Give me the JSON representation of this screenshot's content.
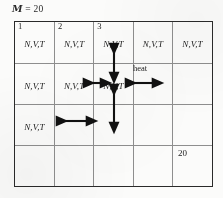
{
  "caption": {
    "symbol": "M",
    "equals": " = 20"
  },
  "colors": {
    "ink": "#1d1d1d",
    "outer_border": "#2a2a2a",
    "inner_border": "#8e8e8e",
    "page_background": "#fbfbfa"
  },
  "grid": {
    "columns": 5,
    "rows": 4,
    "rows_data": [
      {
        "cells": [
          {
            "corner": "1",
            "text": "N,V,T"
          },
          {
            "corner": "2",
            "text": "N,V,T"
          },
          {
            "corner": "3",
            "text": "N,V,T"
          },
          {
            "corner": "",
            "text": "N,V,T"
          },
          {
            "corner": "",
            "text": "N,V,T"
          }
        ]
      },
      {
        "cells": [
          {
            "corner": "",
            "text": "N,V,T"
          },
          {
            "corner": "",
            "text": "N,V,T"
          },
          {
            "corner": "",
            "text": "N,V,T"
          },
          {
            "corner": "",
            "text": ""
          },
          {
            "corner": "",
            "text": ""
          }
        ]
      },
      {
        "cells": [
          {
            "corner": "",
            "text": "N,V,T"
          },
          {
            "corner": "",
            "text": ""
          },
          {
            "corner": "",
            "text": ""
          },
          {
            "corner": "",
            "text": ""
          },
          {
            "corner": "",
            "text": ""
          }
        ]
      },
      {
        "cells": [
          {
            "corner": "",
            "text": ""
          },
          {
            "corner": "",
            "text": ""
          },
          {
            "corner": "",
            "text": ""
          },
          {
            "corner": "",
            "text": ""
          },
          {
            "corner": "",
            "text": ""
          }
        ]
      }
    ],
    "bottom_right_value": "20"
  },
  "annotations": {
    "heat_label": "heat",
    "arrows": [
      {
        "name": "arrow-up-center",
        "direction": "vertical"
      },
      {
        "name": "arrow-down-center",
        "direction": "vertical"
      },
      {
        "name": "arrow-left-center",
        "direction": "horizontal"
      },
      {
        "name": "arrow-heat-right",
        "direction": "horizontal"
      },
      {
        "name": "arrow-row3-horizontal",
        "direction": "horizontal"
      }
    ]
  }
}
